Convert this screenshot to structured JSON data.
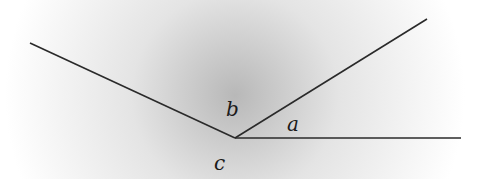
{
  "diagram": {
    "type": "angles-at-a-point",
    "vertex": [
      235,
      138
    ],
    "rays": [
      {
        "name": "left-ray",
        "end": [
          30,
          43
        ]
      },
      {
        "name": "upper-right-ray",
        "end": [
          427,
          19
        ]
      },
      {
        "name": "horizontal-ray",
        "end": [
          461,
          138
        ]
      }
    ],
    "labels": {
      "a": "a",
      "b": "b",
      "c": "c"
    },
    "colors": {
      "line": "#2a2a2a",
      "shade": "#bdbdbd",
      "background": "#ffffff"
    }
  }
}
